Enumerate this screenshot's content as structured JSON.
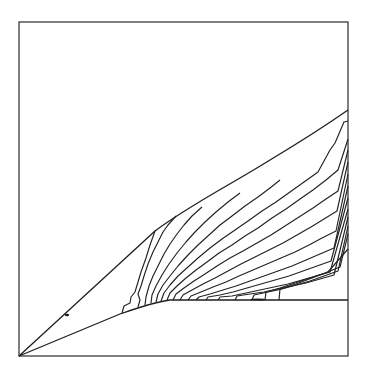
{
  "figure": {
    "type": "contour-plot",
    "frame": {
      "x": 19,
      "y": 22,
      "width": 329,
      "height": 334
    },
    "colors": {
      "line": "#1e1e1e",
      "frame": "#2a2a2a",
      "background": "#ffffff"
    },
    "shock": "M19,356 L155,231 C190,205 230,185 270,160 C300,142 325,126 348,110",
    "body": "M19,356 L120,314 C140,307 155,302 170,300 L348,300",
    "marks": [
      {
        "name": "shock-tick",
        "cx": 67,
        "cy": 315,
        "rx": 2.2,
        "ry": 1.3
      },
      {
        "name": "wall-bump",
        "cx": 258,
        "cy": 299.5,
        "rx": 8,
        "ry": 1.1
      }
    ],
    "contours": [
      "M122,313 L124,306 L130,303 L131,297 L135,292 L138,282 L141,272 L146,258 L150,245 L155,231",
      "M138,307 L140,300 L138,294 L141,286 L144,276 L148,264 L153,252 L158,242 L163,232 L168,225 L176,216",
      "M145,305 L146,297 L149,286 L153,276 L158,266 L164,254 L170,244 L177,234 L184,225 L192,216 L202,207",
      "M151,303 L152,295 L156,286 L162,275 L169,264 L177,253 L186,242 L195,232 L205,222 L216,212 L228,202 L240,193",
      "M156,302 L158,294 L163,285 L170,276 L178,266 L188,255 L198,245 L209,235 L220,225 L232,216 L245,206 L258,197 L270,188 L280,180",
      "M161,301 L164,293 L170,285 L178,276 L188,267 L198,258 L210,248 L222,239 L235,230 L248,221 L262,211 L276,202 L290,192 L304,182 L318,172 L330,150 L335,143 L344,122 L348,121",
      "M167,300 L170,293 L177,286 L186,278 L196,270 L207,262 L219,253 L232,245 L245,236 L258,228 L272,218 L286,209 L300,199 L313,190 L326,180 L338,170 L348,139",
      "M173,300 L176,294 L184,288 L194,281 L205,274 L217,266 L230,258 L243,251 L257,243 L271,235 L285,226 L299,217 L313,208 L326,199 L338,191 L348,150",
      "M180,300 L183,295 L192,290 L203,284 L215,278 L228,271 L241,264 L255,257 L269,250 L283,243 L297,235 L311,227 L324,219 L337,211 L348,162",
      "M188,300 L191,296 L201,292 L213,287 L226,282 L239,276 L253,270 L267,264 L281,258 L295,252 L309,245 L322,238 L336,231 L348,174",
      "M196,300 L199,297 L210,294 L223,290 L236,286 L250,281 L264,276 L278,271 L292,266 L306,260 L320,254 L334,248 L348,186",
      "M206,300 L208,297 L220,295 L233,292 L247,288 L261,284 L275,280 L289,276 L303,271 L317,266 L331,261 L348,198",
      "M218,300 L220,297 L232,296 L246,293 L260,290 L274,287 L288,284 L302,280 L316,276 L330,272 L348,209",
      "M235,300 L237,296 L250,294 L264,292 L278,289 L292,286 L306,283 L320,279 L334,275 L348,217",
      "M252,300 L254,295 L268,292 L282,289 L296,285 L310,281 L324,276 L338,271 L348,226",
      "M265,300 L266,292 L280,288 L295,283 L310,278 L325,273 L340,267 L348,234",
      "M279,300 L280,289 L296,284 L312,278 L328,272 L348,249"
    ]
  }
}
